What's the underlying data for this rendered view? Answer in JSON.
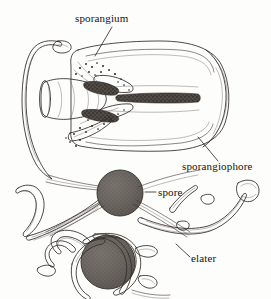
{
  "figure": {
    "title": "sporangium",
    "caption": "",
    "background_color": "#fdfdfc",
    "ink_color": "#2e2a27",
    "spore_fill": "#77716c",
    "spore_mass_fill": "#3a3633",
    "tissue_fill": "#f2f1ee",
    "labels": [
      {
        "id": "sporangium",
        "text": "sporangium",
        "x": 75,
        "y": 22,
        "anchor": "start"
      },
      {
        "id": "sporangiophore",
        "text": "sporangiophore",
        "x": 182,
        "y": 170,
        "anchor": "start"
      },
      {
        "id": "spore",
        "text": "spore",
        "x": 158,
        "y": 196,
        "anchor": "start"
      },
      {
        "id": "elater",
        "text": "elater",
        "x": 191,
        "y": 262,
        "anchor": "start"
      }
    ],
    "parts": [
      {
        "id": "sporangium-capsule",
        "name": "sporangium capsule"
      },
      {
        "id": "sporangiophore-stalk",
        "name": "sporangiophore stalk"
      },
      {
        "id": "spore-upper",
        "name": "free spore"
      },
      {
        "id": "spore-lower",
        "name": "spore with coiled elaters"
      },
      {
        "id": "elater-right",
        "name": "elater"
      },
      {
        "id": "elater-left",
        "name": "elater"
      },
      {
        "id": "spore-mass-upper",
        "name": "upper spore mass"
      },
      {
        "id": "spore-mass-lower",
        "name": "lower spore mass"
      }
    ]
  }
}
